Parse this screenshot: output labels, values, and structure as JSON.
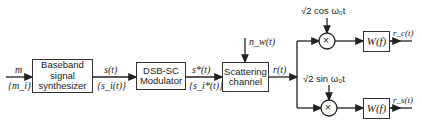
{
  "blocks": {
    "baseband": {
      "line1": "Baseband",
      "line2": "signal",
      "line3": "synthesizer"
    },
    "modulator": {
      "line1": "DSB-SC",
      "line2": "Modulator"
    },
    "channel": {
      "line1": "Scattering",
      "line2": "channel"
    },
    "filter_upper": {
      "label": "W(f)"
    },
    "filter_lower": {
      "label": "W(f)"
    }
  },
  "signals": {
    "input_top": "m",
    "input_bottom": "{m_i}",
    "baseband_out_top": "s(t)",
    "baseband_out_bottom": "{s_i(t)}",
    "mod_out_top": "s*(t)",
    "mod_out_bottom": "{s_i*(t)}",
    "noise": "n_w(t)",
    "channel_out": "r(t)",
    "out_upper": "r_c(t)",
    "out_lower": "r_s(t)"
  },
  "references": {
    "cos_sqrt": "√2",
    "cos_text": "cos ω₀t",
    "sin_sqrt": "√2",
    "sin_text": "sin ω₀t"
  },
  "multiplier_symbol": "×",
  "colors": {
    "line": "#222222",
    "background": "#ffffff"
  }
}
